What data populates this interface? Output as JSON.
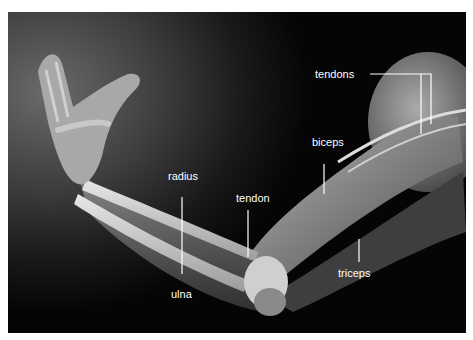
{
  "diagram": {
    "labels": {
      "tendons": "tendons",
      "biceps": "biceps",
      "radius": "radius",
      "tendon": "tendon",
      "triceps": "triceps",
      "ulna": "ulna"
    }
  }
}
